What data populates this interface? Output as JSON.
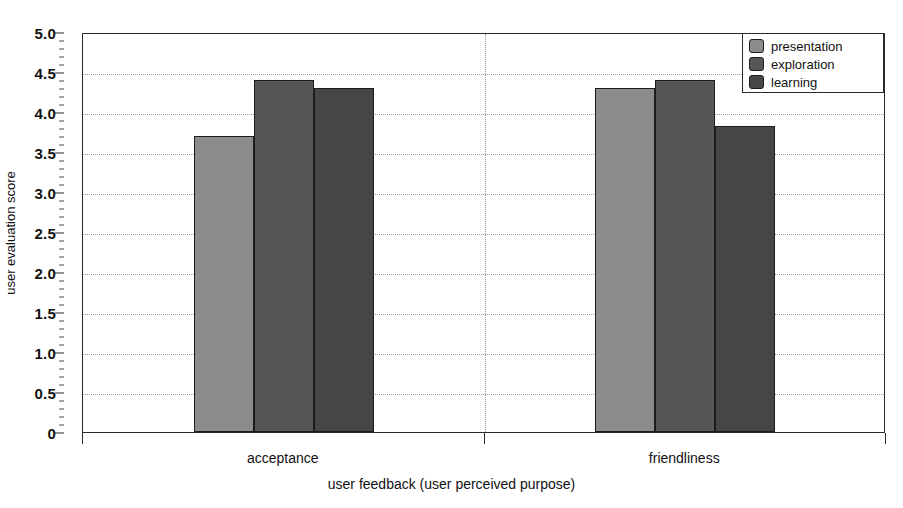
{
  "chart_data": {
    "type": "bar",
    "title": "",
    "xlabel": "user feedback (user perceived purpose)",
    "ylabel": "user evaluation score",
    "categories": [
      "acceptance",
      "friendliness"
    ],
    "series": [
      {
        "name": "presentation",
        "color": "#8c8c8c",
        "values": [
          3.7,
          4.3
        ]
      },
      {
        "name": "exploration",
        "color": "#565656",
        "values": [
          4.4,
          4.4
        ]
      },
      {
        "name": "learning",
        "color": "#464646",
        "values": [
          4.3,
          3.82
        ]
      }
    ],
    "ylim": [
      0,
      5
    ],
    "ytick_labels": [
      "0",
      "0.5",
      "1.0",
      "1.5",
      "2.0",
      "2.5",
      "3.0",
      "3.5",
      "4.0",
      "4.5",
      "5.0"
    ],
    "ytick_values": [
      0,
      0.5,
      1.0,
      1.5,
      2.0,
      2.5,
      3.0,
      3.5,
      4.0,
      4.5,
      5.0
    ],
    "yminor_step": 0.1,
    "grid": true,
    "grid_style": "dotted",
    "legend_position": "top-right",
    "bar_group_gap": true
  },
  "legend": {
    "items": [
      {
        "label": "presentation",
        "color": "#8c8c8c"
      },
      {
        "label": "exploration",
        "color": "#565656"
      },
      {
        "label": "learning",
        "color": "#464646"
      }
    ]
  },
  "axes": {
    "y_title": "user evaluation score",
    "x_title": "user feedback (user perceived purpose)"
  },
  "colors": {
    "frame": "#2b2b2b",
    "grid": "#9a9a9a",
    "background": "#ffffff",
    "text": "#111111"
  }
}
